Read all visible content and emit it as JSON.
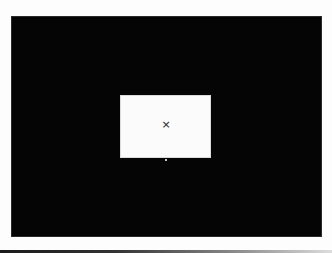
{
  "header": {
    "clipped_text": ""
  },
  "viewer": {
    "background_color": "#050505"
  },
  "dialog": {
    "close_glyph": "×",
    "background_color": "#fbfbfb"
  }
}
